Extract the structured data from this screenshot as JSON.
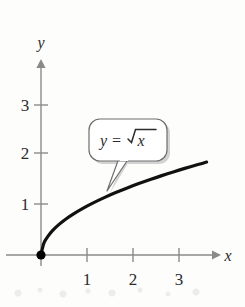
{
  "chart_data": {
    "type": "line",
    "title": "",
    "xlabel": "x",
    "ylabel": "y",
    "xlim": [
      0,
      3.8
    ],
    "ylim": [
      0,
      3.6
    ],
    "grid": false,
    "legend": "none",
    "annotations": [
      {
        "name": "equation-callout",
        "text": "y = √x",
        "parts": {
          "lhs": "y",
          "equals": "=",
          "radicand": "x"
        },
        "points_to": {
          "x": 1.35,
          "y": 1.17
        }
      }
    ],
    "series": [
      {
        "name": "y = √x",
        "color": "#111111",
        "x": [
          0,
          0.05,
          0.1,
          0.2,
          0.3,
          0.4,
          0.5,
          0.6,
          0.8,
          1.0,
          1.25,
          1.5,
          1.75,
          2.0,
          2.25,
          2.5,
          2.75,
          3.0,
          3.25,
          3.5,
          3.6
        ],
        "y": [
          0,
          0.224,
          0.316,
          0.447,
          0.548,
          0.632,
          0.707,
          0.775,
          0.894,
          1.0,
          1.118,
          1.225,
          1.323,
          1.414,
          1.5,
          1.581,
          1.658,
          1.732,
          1.803,
          1.871,
          1.897
        ]
      }
    ],
    "markers": [
      {
        "name": "origin-point",
        "x": 0,
        "y": 0,
        "style": "filled-circle",
        "color": "#000000"
      }
    ],
    "x_axis": {
      "ticks": [
        1,
        2,
        3
      ],
      "tick_labels": [
        "1",
        "2",
        "3"
      ],
      "label": "x",
      "arrow": true,
      "color": "#8a8a8a"
    },
    "y_axis": {
      "ticks": [
        1,
        2,
        3
      ],
      "tick_labels": [
        "1",
        "2",
        "3"
      ],
      "label": "y",
      "arrow": true,
      "color": "#8a8a8a"
    }
  },
  "figure": {
    "background": "#fdfdfb",
    "curve_color": "#111111",
    "axis_color": "#8a8a8a",
    "callout_border_color": "#6e6e6e",
    "callout_fill": "#ffffff",
    "callout_shadow": "#c9c9c9",
    "text_color": "#2b2b2b"
  }
}
